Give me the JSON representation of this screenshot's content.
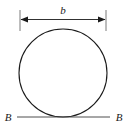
{
  "figure": {
    "background_color": "#ffffff",
    "stroke_color": "#1a1a1a",
    "dimension": {
      "label": "b",
      "description": "width dimension of circle",
      "line_y": 19,
      "x_start": 20,
      "x_end": 106
    },
    "baseline": {
      "left_label": "B",
      "right_label": "B",
      "line_y": 117,
      "x_start": 17,
      "x_end": 110
    },
    "circle": {
      "center_x": 63,
      "center_y": 73,
      "radius": 44
    },
    "extension_lines": [
      {
        "x": 20,
        "y_top": 10,
        "y_bottom": 31
      },
      {
        "x": 106,
        "y_top": 10,
        "y_bottom": 31
      }
    ]
  },
  "colors": {
    "ink": "#1a1a1a",
    "thin_rule": "#2b2b2b",
    "paper": "#ffffff"
  }
}
